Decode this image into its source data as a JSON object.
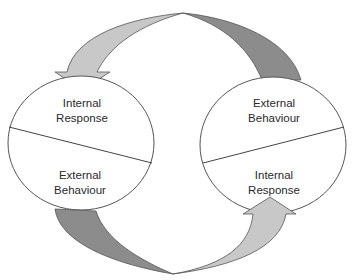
{
  "diagram": {
    "type": "cycle",
    "colors": {
      "background": "#ffffff",
      "outline": "#555555",
      "arrow_light": "#c8c8c8",
      "arrow_dark": "#8c8c8c"
    },
    "left_circle": {
      "top_label_line1": "Internal",
      "top_label_line2": "Response",
      "bottom_label_line1": "External",
      "bottom_label_line2": "Behaviour"
    },
    "right_circle": {
      "top_label_line1": "External",
      "top_label_line2": "Behaviour",
      "bottom_label_line1": "Internal",
      "bottom_label_line2": "Response"
    },
    "arrows": [
      {
        "from": "right_circle.top",
        "to": "left_circle.top",
        "shade": "light-head / dark-tail"
      },
      {
        "from": "left_circle.bottom",
        "to": "right_circle.bottom",
        "shade": "dark-tail / light-head"
      }
    ]
  }
}
